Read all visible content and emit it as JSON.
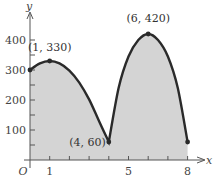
{
  "chart_data": {
    "type": "area",
    "title": "",
    "xlabel": "x",
    "ylabel": "y",
    "origin_label": "O",
    "xlim": [
      0,
      8.4
    ],
    "ylim": [
      0,
      460
    ],
    "grid": false,
    "x_ticks": [
      1,
      2,
      3,
      4,
      5,
      6,
      7,
      8
    ],
    "x_tick_labels": [
      {
        "value": 1,
        "label": "1"
      },
      {
        "value": 5,
        "label": "5"
      },
      {
        "value": 8,
        "label": "8"
      }
    ],
    "y_ticks": [
      50,
      100,
      150,
      200,
      250,
      300,
      350,
      400
    ],
    "y_tick_labels": [
      {
        "value": 100,
        "label": "100"
      },
      {
        "value": 200,
        "label": "200"
      },
      {
        "value": 300,
        "label": "300"
      },
      {
        "value": 400,
        "label": "400"
      }
    ],
    "series": [
      {
        "name": "curve",
        "points": [
          {
            "x": 0,
            "y": 300
          },
          {
            "x": 0.5,
            "y": 322
          },
          {
            "x": 1,
            "y": 330
          },
          {
            "x": 1.5,
            "y": 322
          },
          {
            "x": 2,
            "y": 298
          },
          {
            "x": 2.5,
            "y": 258
          },
          {
            "x": 3,
            "y": 202
          },
          {
            "x": 3.5,
            "y": 130
          },
          {
            "x": 4,
            "y": 60
          },
          {
            "x": 4.5,
            "y": 240
          },
          {
            "x": 5,
            "y": 345
          },
          {
            "x": 5.5,
            "y": 400
          },
          {
            "x": 6,
            "y": 420
          },
          {
            "x": 6.5,
            "y": 400
          },
          {
            "x": 7,
            "y": 345
          },
          {
            "x": 7.5,
            "y": 240
          },
          {
            "x": 8,
            "y": 60
          }
        ],
        "fill": "#d4d4d4",
        "stroke": "#2a2a2a"
      }
    ],
    "annotations": [
      {
        "x": 1,
        "y": 330,
        "label": "(1, 330)"
      },
      {
        "x": 4,
        "y": 60,
        "label": "(4, 60)"
      },
      {
        "x": 6,
        "y": 420,
        "label": "(6, 420)"
      }
    ],
    "marked_points": [
      {
        "x": 0,
        "y": 300
      },
      {
        "x": 1,
        "y": 330
      },
      {
        "x": 4,
        "y": 60
      },
      {
        "x": 6,
        "y": 420
      },
      {
        "x": 8,
        "y": 60
      }
    ]
  }
}
